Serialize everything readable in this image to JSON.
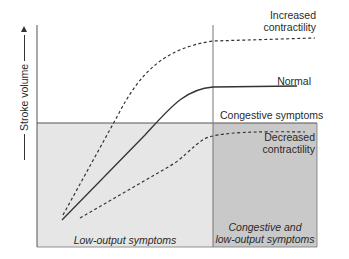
{
  "diagram": {
    "type": "frank-starling-curves",
    "y_axis": {
      "label": "Stroke volume",
      "arrow": "up"
    },
    "regions": {
      "congestive_threshold_label": "Congestive symptoms",
      "low_output": {
        "label": "Low-output symptoms",
        "fill": "#e6e6e6"
      },
      "congestive_and_low_output": {
        "label_line1": "Congestive and",
        "label_line2": "low-output symptoms",
        "fill": "#c9c9c9"
      }
    },
    "curves": [
      {
        "name": "Increased contractility",
        "label_line1": "Increased",
        "label_line2": "contractility",
        "style": "dashed"
      },
      {
        "name": "Normal",
        "label": "Normal",
        "style": "solid"
      },
      {
        "name": "Decreased contractility",
        "label_line1": "Decreased",
        "label_line2": "contractility",
        "style": "dashed"
      }
    ],
    "colors": {
      "line": "#333333",
      "axis": "#555555",
      "text": "#2a2a2a"
    }
  }
}
